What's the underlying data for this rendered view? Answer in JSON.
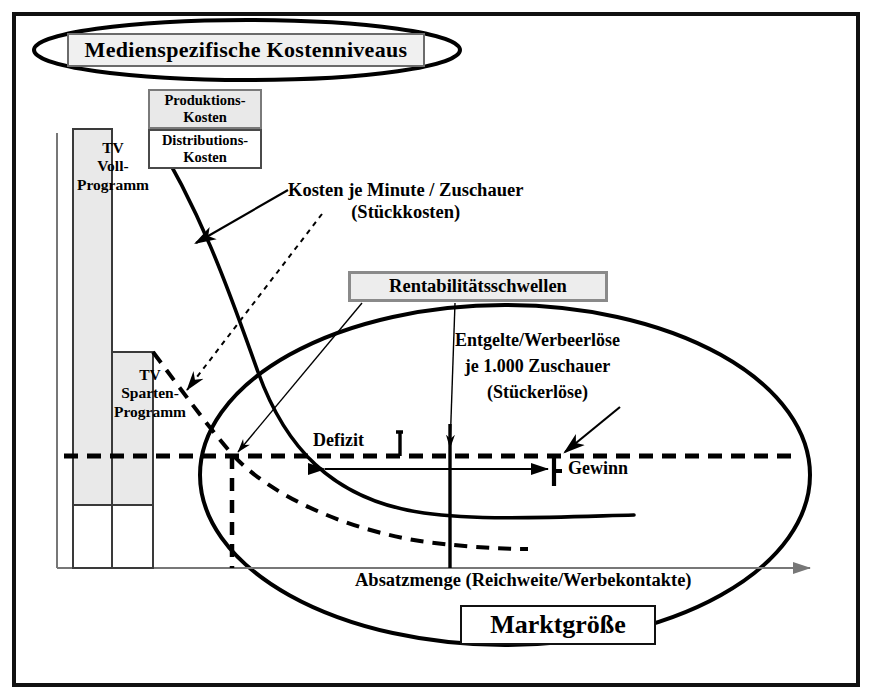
{
  "diagram": {
    "title": "Medienspezifische Kostenniveaus",
    "cost_levels": {
      "production": "Produktions-\nKosten",
      "distribution": "Distributions-\nKosten"
    },
    "bars": {
      "full_program": "TV\nVoll-\nProgramm",
      "niche_program": "TV\nSparten-\nProgramm"
    },
    "annotations": {
      "unit_costs": "Kosten je Minute / Zuschauer\n(Stückkosten)",
      "break_even": "Rentabilitätsschwellen",
      "unit_revenue": "Entgelte/Werbeerlöse\nje 1.000  Zuschauer\n(Stückerlöse)",
      "deficit": "Defizit",
      "profit": "Gewinn"
    },
    "axis": {
      "x_label": "Absatzmenge (Reichweite/Werbekontakte)"
    },
    "market_size": "Marktgröße",
    "colors": {
      "line": "#000000",
      "gray_fill": "#e9e9e9",
      "box_gray": "#ededed",
      "axis_gray": "#777777",
      "frame": "#111111"
    }
  }
}
